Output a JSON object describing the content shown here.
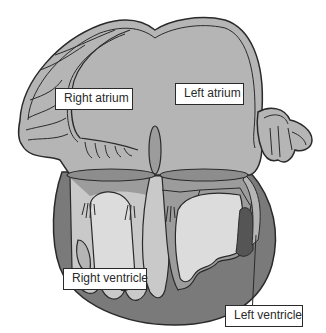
{
  "diagram": {
    "labels": {
      "right_atrium": "Right atrium",
      "left_atrium": "Left atrium",
      "right_ventricle": "Right ventricle",
      "left_ventricle": "Left ventricle"
    },
    "colors": {
      "background": "#ffffff",
      "atrium_fill": "#b5b5b5",
      "wall_dark": "#7a7a7a",
      "ventricle_mid": "#9c9c9c",
      "ventricle_light": "#c9c9c9",
      "valve_band": "#8d8d8d",
      "outline": "#2a2a2a",
      "septum_dark": "#555555"
    }
  }
}
